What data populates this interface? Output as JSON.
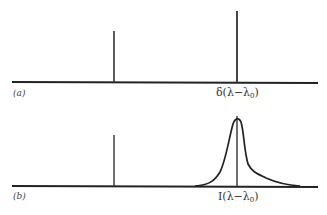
{
  "figure": {
    "panels": [
      {
        "id": "a",
        "label": "(a)",
        "line_label_prefix": "δ(λ−λ",
        "line_label_sub": "0",
        "line_label_suffix": ")",
        "description": "Two delta-function spectral lines"
      },
      {
        "id": "b",
        "label": "(b)",
        "line_label_prefix": "I(λ−λ",
        "line_label_sub": "0",
        "line_label_suffix": ")",
        "description": "Delta line plus broadened line profile at λ0"
      }
    ]
  }
}
